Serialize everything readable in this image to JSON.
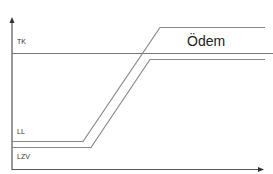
{
  "diagram": {
    "labels": {
      "tk": "TK",
      "ll": "LL",
      "lzv": "LZV",
      "region": "Ödem"
    },
    "colors": {
      "axis": "#333333",
      "line": "#888888",
      "tk_line": "#777777"
    },
    "axes": {
      "x_axis": {
        "arrow": true
      },
      "y_axis": {
        "arrow": true
      }
    }
  }
}
